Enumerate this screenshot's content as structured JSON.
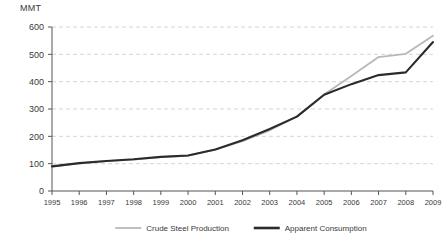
{
  "chart_data": {
    "type": "line",
    "title": "",
    "xlabel": "",
    "ylabel": "MMT",
    "unit_label": "MMT",
    "x": [
      1995,
      1996,
      1997,
      1998,
      1999,
      2000,
      2001,
      2002,
      2003,
      2004,
      2005,
      2006,
      2007,
      2008,
      2009
    ],
    "categories": [
      "1995",
      "1996",
      "1997",
      "1998",
      "1999",
      "2000",
      "2001",
      "2002",
      "2003",
      "2004",
      "2005",
      "2006",
      "2007",
      "2008",
      "2009"
    ],
    "xlim": [
      1995,
      2009
    ],
    "ylim": [
      0,
      600
    ],
    "yticks": [
      0,
      100,
      200,
      300,
      400,
      500,
      600
    ],
    "ytick_labels": [
      "0",
      "100",
      "200",
      "300",
      "400",
      "500",
      "600"
    ],
    "grid": true,
    "grid_style": "dashed-horizontal",
    "legend_position": "bottom",
    "series": [
      {
        "name": "Crude Steel Production",
        "color": "#b8b8b8",
        "values": [
          89,
          101,
          109,
          115,
          124,
          129,
          151,
          182,
          222,
          273,
          353,
          421,
          490,
          502,
          568
        ]
      },
      {
        "name": "Apparent Consumption",
        "color": "#2b2b2b",
        "values": [
          90,
          102,
          110,
          116,
          125,
          130,
          152,
          186,
          227,
          272,
          352,
          391,
          424,
          434,
          545
        ]
      }
    ]
  },
  "legend": {
    "items": [
      {
        "label": "Crude Steel Production",
        "color": "#b8b8b8"
      },
      {
        "label": "Apparent Consumption",
        "color": "#2b2b2b"
      }
    ]
  }
}
